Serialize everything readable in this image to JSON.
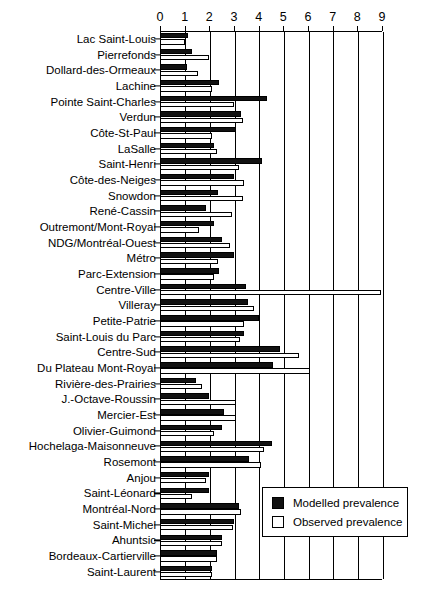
{
  "chart_data": {
    "type": "bar",
    "orientation": "horizontal",
    "title": "",
    "xlabel": "",
    "ylabel": "",
    "xlim": [
      0,
      9
    ],
    "xticks": [
      0,
      1,
      2,
      3,
      4,
      5,
      6,
      7,
      8,
      9
    ],
    "grid": true,
    "legend_position": "bottom-right",
    "categories": [
      "Lac Saint-Louis",
      "Pierrefonds",
      "Dollard-des-Ormeaux",
      "Lachine",
      "Pointe Saint-Charles",
      "Verdun",
      "Côte-St-Paul",
      "LaSalle",
      "Saint-Henri",
      "Côte-des-Neiges",
      "Snowdon",
      "René-Cassin",
      "Outremont/Mont-Royal",
      "NDG/Montréal-Ouest",
      "Métro",
      "Parc-Extension",
      "Centre-Ville",
      "Villeray",
      "Petite-Patrie",
      "Saint-Louis du Parc",
      "Centre-Sud",
      "Du Plateau Mont-Royal",
      "Rivière-des-Prairies",
      "J.-Octave-Roussin",
      "Mercier-Est",
      "Olivier-Guimond",
      "Hochelaga-Maisonneuve",
      "Rosemont",
      "Anjou",
      "Saint-Léonard",
      "Montréal-Nord",
      "Saint-Michel",
      "Ahuntsic",
      "Bordeaux-Cartierville",
      "Saint-Laurent"
    ],
    "series": [
      {
        "name": "Modelled prevalence",
        "color": "#111111",
        "values": [
          1.15,
          1.3,
          1.1,
          2.4,
          4.35,
          3.3,
          3.1,
          2.2,
          4.15,
          3.0,
          2.35,
          1.85,
          2.2,
          2.5,
          3.0,
          2.4,
          3.5,
          3.55,
          4.0,
          3.4,
          4.85,
          4.6,
          1.45,
          2.0,
          2.6,
          2.5,
          4.55,
          3.6,
          2.0,
          2.0,
          3.2,
          3.0,
          2.5,
          2.3,
          2.1
        ]
      },
      {
        "name": "Observed prevalence",
        "color": "#ffffff",
        "values": [
          1.0,
          2.0,
          1.55,
          2.1,
          3.0,
          3.35,
          2.1,
          2.3,
          3.2,
          3.4,
          3.35,
          2.9,
          1.6,
          2.85,
          2.35,
          2.2,
          8.95,
          3.8,
          3.4,
          3.25,
          5.65,
          6.1,
          1.7,
          3.1,
          3.1,
          2.2,
          4.2,
          4.1,
          1.85,
          1.3,
          3.3,
          2.95,
          2.5,
          2.3,
          2.1
        ]
      }
    ]
  },
  "legend": {
    "items": [
      {
        "label": "Modelled prevalence",
        "swatch": "filled"
      },
      {
        "label": "Observed prevalence",
        "swatch": "hollow"
      }
    ]
  }
}
